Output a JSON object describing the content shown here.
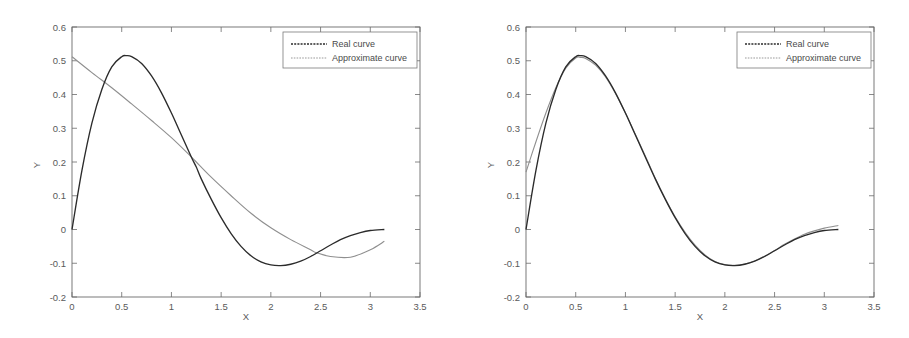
{
  "figure": {
    "background_color": "#ffffff",
    "panel_count": 2
  },
  "chart_data": [
    {
      "type": "line",
      "panel": "left",
      "title": "",
      "xlabel": "X",
      "ylabel": "Y",
      "xlim": [
        0,
        3.5
      ],
      "ylim": [
        -0.2,
        0.6
      ],
      "xticks": [
        0,
        0.5,
        1,
        1.5,
        2,
        2.5,
        3,
        3.5
      ],
      "xtick_labels": [
        "0",
        "0.5",
        "1",
        "1.5",
        "2",
        "2.5",
        "3",
        "3.5"
      ],
      "yticks": [
        -0.2,
        -0.1,
        0,
        0.1,
        0.2,
        0.3,
        0.4,
        0.5,
        0.6
      ],
      "ytick_labels": [
        "-0.2",
        "-0.1",
        "0",
        "0.1",
        "0.2",
        "0.3",
        "0.4",
        "0.5",
        "0.6"
      ],
      "grid": false,
      "legend_position": "upper right",
      "legend": [
        "Real curve",
        "Approximate curve"
      ],
      "series": [
        {
          "name": "Real curve",
          "color": "#2b2b2b",
          "x": [
            0,
            0.1,
            0.2,
            0.3,
            0.4,
            0.5,
            0.55,
            0.6,
            0.7,
            0.8,
            0.9,
            1.0,
            1.1,
            1.2,
            1.25,
            1.3,
            1.4,
            1.5,
            1.6,
            1.7,
            1.8,
            1.9,
            2.0,
            2.1,
            2.2,
            2.3,
            2.4,
            2.5,
            2.6,
            2.7,
            2.8,
            2.9,
            3.0,
            3.1416
          ],
          "y": [
            0.0,
            0.175,
            0.315,
            0.415,
            0.482,
            0.512,
            0.515,
            0.512,
            0.492,
            0.455,
            0.405,
            0.345,
            0.28,
            0.215,
            0.185,
            0.15,
            0.09,
            0.035,
            -0.012,
            -0.05,
            -0.078,
            -0.096,
            -0.105,
            -0.107,
            -0.103,
            -0.094,
            -0.08,
            -0.063,
            -0.046,
            -0.03,
            -0.018,
            -0.009,
            -0.003,
            0.0
          ]
        },
        {
          "name": "Approximate curve",
          "color": "#8f8f8f",
          "x": [
            0,
            0.2,
            0.4,
            0.6,
            0.8,
            1.0,
            1.2,
            1.25,
            1.4,
            1.6,
            1.8,
            2.0,
            2.2,
            2.4,
            2.45,
            2.6,
            2.8,
            3.0,
            3.1416
          ],
          "y": [
            0.512,
            0.465,
            0.42,
            0.372,
            0.323,
            0.272,
            0.215,
            0.2,
            0.155,
            0.1,
            0.048,
            0.005,
            -0.03,
            -0.06,
            -0.068,
            -0.08,
            -0.082,
            -0.06,
            -0.035
          ]
        }
      ]
    },
    {
      "type": "line",
      "panel": "right",
      "title": "",
      "xlabel": "X",
      "ylabel": "Y",
      "xlim": [
        0,
        3.5
      ],
      "ylim": [
        -0.2,
        0.6
      ],
      "xticks": [
        0,
        0.5,
        1,
        1.5,
        2,
        2.5,
        3,
        3.5
      ],
      "xtick_labels": [
        "0",
        "0.5",
        "1",
        "1.5",
        "2",
        "2.5",
        "3",
        "3.5"
      ],
      "yticks": [
        -0.2,
        -0.1,
        0,
        0.1,
        0.2,
        0.3,
        0.4,
        0.5,
        0.6
      ],
      "ytick_labels": [
        "-0.2",
        "-0.1",
        "0",
        "0.1",
        "0.2",
        "0.3",
        "0.4",
        "0.5",
        "0.6"
      ],
      "grid": false,
      "legend_position": "upper right",
      "legend": [
        "Real curve",
        "Approximate curve"
      ],
      "series": [
        {
          "name": "Real curve",
          "color": "#2b2b2b",
          "x": [
            0,
            0.1,
            0.2,
            0.3,
            0.4,
            0.5,
            0.55,
            0.6,
            0.7,
            0.8,
            0.9,
            1.0,
            1.1,
            1.2,
            1.3,
            1.4,
            1.5,
            1.6,
            1.7,
            1.8,
            1.9,
            2.0,
            2.1,
            2.2,
            2.3,
            2.4,
            2.5,
            2.6,
            2.7,
            2.8,
            2.9,
            3.0,
            3.1416
          ],
          "y": [
            0.0,
            0.175,
            0.315,
            0.415,
            0.482,
            0.512,
            0.515,
            0.512,
            0.492,
            0.455,
            0.405,
            0.345,
            0.28,
            0.215,
            0.15,
            0.09,
            0.035,
            -0.012,
            -0.05,
            -0.078,
            -0.096,
            -0.105,
            -0.107,
            -0.103,
            -0.094,
            -0.08,
            -0.063,
            -0.046,
            -0.03,
            -0.018,
            -0.009,
            -0.003,
            0.0
          ]
        },
        {
          "name": "Approximate curve",
          "color": "#8f8f8f",
          "x": [
            0,
            0.1,
            0.2,
            0.3,
            0.4,
            0.5,
            0.55,
            0.6,
            0.7,
            0.8,
            0.9,
            1.0,
            1.1,
            1.2,
            1.3,
            1.4,
            1.5,
            1.6,
            1.7,
            1.8,
            1.9,
            2.0,
            2.1,
            2.2,
            2.3,
            2.4,
            2.5,
            2.6,
            2.7,
            2.8,
            2.9,
            3.0,
            3.1416
          ],
          "y": [
            0.17,
            0.26,
            0.345,
            0.42,
            0.478,
            0.508,
            0.51,
            0.507,
            0.487,
            0.452,
            0.403,
            0.345,
            0.282,
            0.218,
            0.152,
            0.092,
            0.038,
            -0.008,
            -0.046,
            -0.075,
            -0.095,
            -0.104,
            -0.106,
            -0.102,
            -0.093,
            -0.079,
            -0.062,
            -0.044,
            -0.028,
            -0.014,
            -0.004,
            0.004,
            0.012
          ]
        }
      ]
    }
  ]
}
